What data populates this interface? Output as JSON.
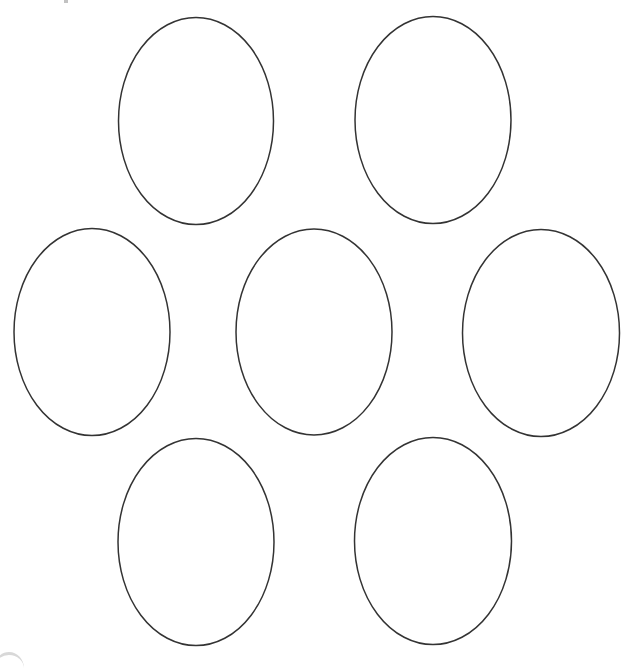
{
  "canvas": {
    "width": 631,
    "height": 662,
    "background": "#ffffff"
  },
  "style": {
    "stroke_color": "#333333",
    "stroke_width": 1.5,
    "fill": "#ffffff"
  },
  "ellipses": [
    {
      "id": "top-left",
      "cx": 196,
      "cy": 121,
      "rx": 77.5,
      "ry": 103.5
    },
    {
      "id": "top-right",
      "cx": 433,
      "cy": 120,
      "rx": 78,
      "ry": 103.5
    },
    {
      "id": "middle-left",
      "cx": 92,
      "cy": 332,
      "rx": 78,
      "ry": 103.5
    },
    {
      "id": "middle-center",
      "cx": 314,
      "cy": 332,
      "rx": 78,
      "ry": 103
    },
    {
      "id": "middle-right",
      "cx": 541,
      "cy": 333,
      "rx": 78.5,
      "ry": 103.5
    },
    {
      "id": "bottom-left",
      "cx": 196,
      "cy": 542,
      "rx": 78,
      "ry": 103.5
    },
    {
      "id": "bottom-right",
      "cx": 433,
      "cy": 541,
      "rx": 78.5,
      "ry": 103.5
    }
  ]
}
